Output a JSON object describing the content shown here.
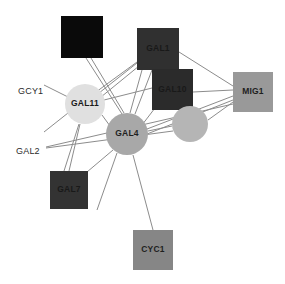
{
  "figure": {
    "type": "node-link-network",
    "width": 285,
    "height": 284,
    "background": "#ffffff",
    "edge_color": "#8c8c8c"
  },
  "nodes": [
    {
      "id": "unlabeled_black",
      "label": "",
      "shape": "square",
      "x": 61,
      "y": 16,
      "w": 42,
      "h": 42,
      "fill": "#0a0a0a",
      "text_class": "on-black"
    },
    {
      "id": "GAL1",
      "label": "GAL1",
      "shape": "square",
      "x": 137,
      "y": 28,
      "w": 42,
      "h": 42,
      "fill": "#303030",
      "text_class": "on-dark"
    },
    {
      "id": "GAL10",
      "label": "GAL10",
      "shape": "square",
      "x": 152,
      "y": 69,
      "w": 41,
      "h": 41,
      "fill": "#2b2b2b",
      "text_class": "on-dark"
    },
    {
      "id": "MIG1",
      "label": "MIG1",
      "shape": "square",
      "x": 233,
      "y": 72,
      "w": 40,
      "h": 40,
      "fill": "#999999",
      "text_class": "on-mid"
    },
    {
      "id": "GAL11",
      "label": "GAL11",
      "shape": "circle",
      "x": 85,
      "y": 104,
      "r": 20,
      "fill": "#e0e0e0",
      "text_class": "on-light"
    },
    {
      "id": "GAL4",
      "label": "GAL4",
      "shape": "circle",
      "x": 127,
      "y": 134,
      "r": 21,
      "fill": "#a8a8a8",
      "text_class": "on-mid"
    },
    {
      "id": "unlabeled_circle",
      "label": "",
      "shape": "circle",
      "x": 190,
      "y": 124,
      "r": 18,
      "fill": "#b5b5b5",
      "text_class": "on-mid"
    },
    {
      "id": "GAL7",
      "label": "GAL7",
      "shape": "square",
      "x": 50,
      "y": 171,
      "w": 38,
      "h": 38,
      "fill": "#333333",
      "text_class": "on-dark"
    },
    {
      "id": "CYC1",
      "label": "CYC1",
      "shape": "square",
      "x": 133,
      "y": 230,
      "w": 40,
      "h": 40,
      "fill": "#868686",
      "text_class": "on-mid"
    }
  ],
  "external_labels": [
    {
      "id": "GCY1",
      "text": "GCY1",
      "x": 18,
      "y": 92
    },
    {
      "id": "GAL2",
      "text": "GAL2",
      "x": 16,
      "y": 152
    }
  ],
  "edges": [
    {
      "from": "unlabeled_black",
      "to": "GAL4",
      "x1": 86,
      "y1": 58,
      "x2": 122,
      "y2": 114
    },
    {
      "from": "GAL1",
      "to": "GAL11",
      "x1": 139,
      "y1": 66,
      "x2": 101,
      "y2": 97
    },
    {
      "from": "GAL1",
      "to": "GAL4",
      "x1": 142,
      "y1": 70,
      "x2": 130,
      "y2": 113
    },
    {
      "from": "GAL1",
      "to": "MIG1",
      "x1": 179,
      "y1": 52,
      "x2": 233,
      "y2": 86
    },
    {
      "from": "GAL1",
      "to": "GAL4_b",
      "x1": 152,
      "y1": 70,
      "x2": 135,
      "y2": 114
    },
    {
      "from": "GAL10",
      "to": "GAL11",
      "x1": 152,
      "y1": 88,
      "x2": 104,
      "y2": 100
    },
    {
      "from": "GAL10",
      "to": "GAL4",
      "x1": 155,
      "y1": 108,
      "x2": 142,
      "y2": 125
    },
    {
      "from": "GAL10",
      "to": "MIG1",
      "x1": 193,
      "y1": 92,
      "x2": 233,
      "y2": 90
    },
    {
      "from": "GAL11",
      "to": "GAL4",
      "x1": 102,
      "y1": 115,
      "x2": 110,
      "y2": 126
    },
    {
      "from": "GAL11",
      "to": "GCY1",
      "x1": 68,
      "y1": 97,
      "x2": 44,
      "y2": 85
    },
    {
      "from": "GAL11",
      "to": "left_low",
      "x1": 68,
      "y1": 113,
      "x2": 44,
      "y2": 132
    },
    {
      "from": "GAL11",
      "to": "GAL7",
      "x1": 80,
      "y1": 124,
      "x2": 69,
      "y2": 171
    },
    {
      "from": "GAL4",
      "to": "GAL7",
      "x1": 113,
      "y1": 150,
      "x2": 87,
      "y2": 172
    },
    {
      "from": "GAL4",
      "to": "CYC1",
      "x1": 133,
      "y1": 155,
      "x2": 153,
      "y2": 230
    },
    {
      "from": "GAL4",
      "to": "below_left",
      "x1": 117,
      "y1": 153,
      "x2": 97,
      "y2": 210
    },
    {
      "from": "GAL4",
      "to": "MIG1_upper",
      "x1": 147,
      "y1": 129,
      "x2": 233,
      "y2": 96
    },
    {
      "from": "GAL4",
      "to": "MIG1_lower",
      "x1": 147,
      "y1": 134,
      "x2": 233,
      "y2": 100
    },
    {
      "from": "GAL4",
      "to": "unlabeled_circle",
      "x1": 148,
      "y1": 131,
      "x2": 172,
      "y2": 126
    },
    {
      "from": "GAL2",
      "to": "MIG1_long",
      "x1": 46,
      "y1": 147,
      "x2": 233,
      "y2": 104
    },
    {
      "from": "unlabeled_circle",
      "to": "MIG1",
      "x1": 208,
      "y1": 120,
      "x2": 233,
      "y2": 102
    },
    {
      "from": "unlabeled_circle",
      "to": "left_long",
      "x1": 173,
      "y1": 131,
      "x2": 46,
      "y2": 148
    },
    {
      "from": "GAL1",
      "to": "GAL11_b",
      "x1": 137,
      "y1": 62,
      "x2": 96,
      "y2": 92
    },
    {
      "from": "GAL11",
      "to": "upper_right",
      "x1": 99,
      "y1": 93,
      "x2": 137,
      "y2": 63
    },
    {
      "from": "GAL4",
      "to": "upper_black",
      "x1": 124,
      "y1": 113,
      "x2": 91,
      "y2": 58
    },
    {
      "from": "GAL7",
      "to": "GAL11_b",
      "x1": 64,
      "y1": 171,
      "x2": 79,
      "y2": 124
    }
  ]
}
